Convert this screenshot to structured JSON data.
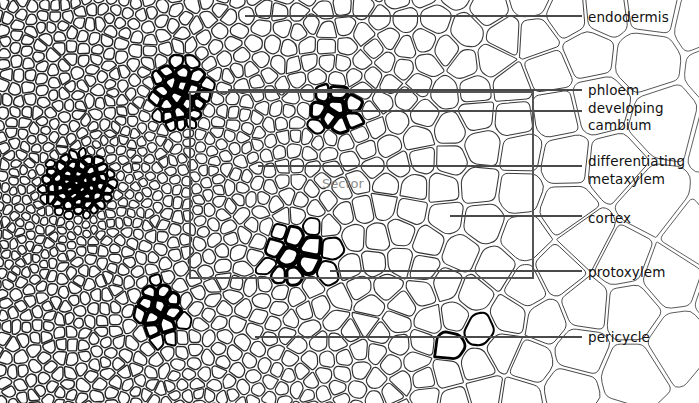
{
  "figure": {
    "background_color": "#ffffff",
    "line_color": "#1a1a1a",
    "thick_wall_color": "#000000",
    "leader_color": "#4a4a4a",
    "overlay_rect_color": "#555555",
    "watermark": {
      "text": "Sector",
      "color": "#7c7c7c"
    }
  },
  "labels": [
    {
      "id": "endodermis",
      "text": "endodermis",
      "x": 588,
      "y": 10,
      "leader_y": 16,
      "leader_x1": 245,
      "leader_x2": 582
    },
    {
      "id": "phloem",
      "text": "phloem",
      "x": 588,
      "y": 83,
      "leader_y": 90,
      "leader_x1": 228,
      "leader_x2": 582
    },
    {
      "id": "developing",
      "text": "developing",
      "x": 588,
      "y": 101,
      "leader_y": null,
      "leader_x1": null,
      "leader_x2": null
    },
    {
      "id": "cambium",
      "text": "cambium",
      "x": 588,
      "y": 118,
      "leader_y": 111,
      "leader_x1": 352,
      "leader_x2": 582
    },
    {
      "id": "differentiating",
      "text": "differentiating",
      "x": 588,
      "y": 154,
      "leader_y": null,
      "leader_x1": null,
      "leader_x2": null
    },
    {
      "id": "metaxylem",
      "text": "metaxylem",
      "x": 588,
      "y": 172,
      "leader_y": 166,
      "leader_x1": 258,
      "leader_x2": 582
    },
    {
      "id": "cortex",
      "text": "cortex",
      "x": 588,
      "y": 211,
      "leader_y": 216,
      "leader_x1": 450,
      "leader_x2": 582
    },
    {
      "id": "protoxylem",
      "text": "protoxylem",
      "x": 588,
      "y": 265,
      "leader_y": 271,
      "leader_x1": 330,
      "leader_x2": 582
    },
    {
      "id": "pericycle",
      "text": "pericycle",
      "x": 588,
      "y": 330,
      "leader_y": 337,
      "leader_x1": 255,
      "leader_x2": 582
    }
  ],
  "overlay_rectangle": {
    "x": 190,
    "y": 92,
    "width": 343,
    "height": 186
  },
  "watermark_position": {
    "x": 322,
    "y": 176
  }
}
